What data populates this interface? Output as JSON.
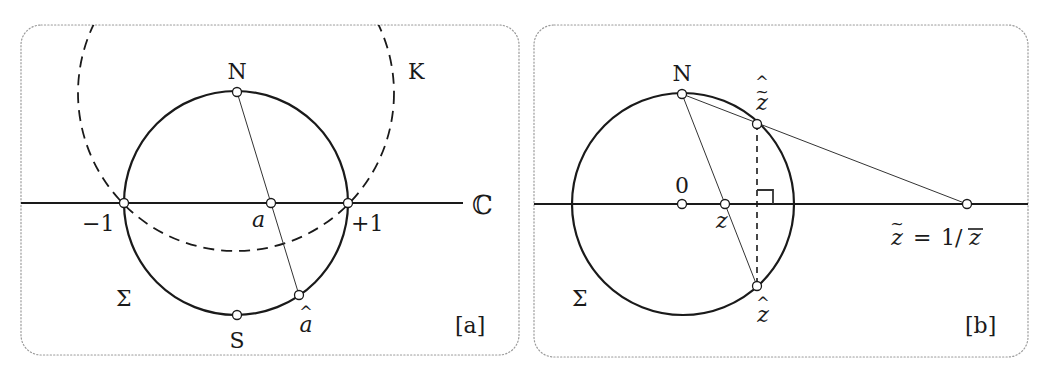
{
  "figure": {
    "panel_a": {
      "tag": "[a]",
      "labels": {
        "north": "N",
        "south": "S",
        "sphere": "Σ",
        "circle_k": "K",
        "minus_one": "−1",
        "plus_one": "+1",
        "point_a": "a",
        "point_a_hat_letter": "a",
        "hat": "^",
        "complex_plane": "ℂ"
      }
    },
    "panel_b": {
      "tag": "[b]",
      "labels": {
        "north": "N",
        "sphere": "Σ",
        "origin": "0",
        "point_z": "z",
        "z_hat_letter": "z",
        "z_tilde_hat_letter": "z",
        "hat": "^",
        "tilde": "~",
        "inverse_lhs_letter": "z",
        "inverse_eq": "=",
        "inverse_rhs": "1/",
        "inverse_rhs_letter": "z"
      }
    }
  }
}
